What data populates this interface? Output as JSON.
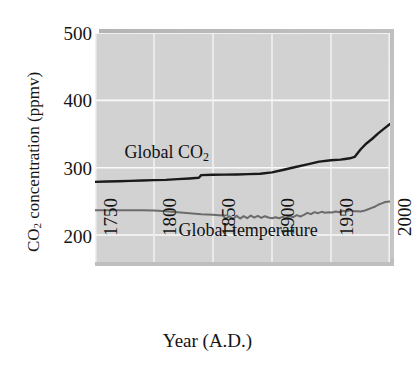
{
  "chart_data": {
    "type": "line",
    "title": "",
    "xlabel": "Year (A.D.)",
    "ylabel": "CO2 concentration (ppmv)",
    "ylabel_parts": {
      "pre": "CO",
      "sub": "2",
      "post": " concentration (ppmv)"
    },
    "xlim": [
      1750,
      2000
    ],
    "ylim": [
      160,
      500
    ],
    "xticks": [
      1750,
      1800,
      1850,
      1900,
      1950,
      2000
    ],
    "xtick_labels": [
      "1750",
      "1800",
      "1850",
      "1900",
      "1950",
      "2000"
    ],
    "yticks": [
      200,
      300,
      400,
      500
    ],
    "ytick_labels": [
      "200",
      "300",
      "400",
      "500"
    ],
    "grid": true,
    "grid_color": "#fafafa",
    "plot_bg": "#d2d2d2",
    "legend_position": "inline-annotations",
    "annotations": [
      {
        "name": "co2-series-label",
        "text": "Global CO",
        "sub": "2",
        "x": 1775,
        "y": 320,
        "color": "#101010"
      },
      {
        "name": "temperature-series-label",
        "text": "Global temperature",
        "x": 1880,
        "y": 205,
        "color": "#101010"
      }
    ],
    "series": [
      {
        "name": "Global CO2",
        "color": "#1a1a1a",
        "width": 2.4,
        "x": [
          1750,
          1760,
          1770,
          1780,
          1790,
          1800,
          1810,
          1820,
          1830,
          1838,
          1840,
          1850,
          1860,
          1870,
          1880,
          1890,
          1900,
          1910,
          1920,
          1930,
          1940,
          1950,
          1958,
          1962,
          1966,
          1970,
          1975,
          1980,
          1985,
          1990,
          1995,
          2000
        ],
        "y": [
          279,
          279.5,
          280,
          280.5,
          281,
          281.5,
          282,
          283,
          284,
          285,
          289,
          289.5,
          289.7,
          290,
          290.5,
          291,
          293,
          297,
          301,
          305,
          309,
          311,
          312,
          313,
          314,
          316,
          327,
          336,
          343,
          351,
          358,
          365
        ]
      },
      {
        "name": "Global temperature",
        "color": "#6b6b6b",
        "width": 2.0,
        "x": [
          1750,
          1760,
          1770,
          1780,
          1790,
          1800,
          1810,
          1820,
          1830,
          1840,
          1850,
          1855,
          1858,
          1861,
          1864,
          1867,
          1870,
          1873,
          1876,
          1879,
          1882,
          1885,
          1888,
          1891,
          1894,
          1897,
          1900,
          1903,
          1906,
          1909,
          1912,
          1915,
          1918,
          1921,
          1924,
          1927,
          1930,
          1933,
          1936,
          1939,
          1942,
          1945,
          1948,
          1951,
          1954,
          1957,
          1960,
          1963,
          1966,
          1969,
          1972,
          1975,
          1978,
          1981,
          1984,
          1987,
          1990,
          1993,
          1996,
          2000
        ],
        "y": [
          237,
          237,
          237,
          237,
          236.8,
          236.5,
          235.5,
          234,
          232.5,
          231,
          230,
          229.5,
          229,
          224.5,
          228,
          224,
          228.5,
          224.5,
          228,
          225,
          229,
          226,
          228.5,
          225.5,
          228,
          226,
          225,
          226.5,
          225,
          227,
          225.5,
          228,
          226.5,
          229.5,
          227.5,
          230,
          233,
          231,
          234,
          232.5,
          234.5,
          233,
          234,
          233.5,
          235,
          234,
          236,
          235,
          237,
          235.5,
          235.5,
          235,
          236,
          238,
          240,
          242,
          245,
          247,
          249,
          250
        ]
      }
    ]
  },
  "axis": {
    "ytick_values": [
      "500",
      "400",
      "300",
      "200"
    ],
    "xtick_values": [
      "1750",
      "1800",
      "1850",
      "1900",
      "1950",
      "2000"
    ],
    "x_title": "Year (A.D.)"
  }
}
